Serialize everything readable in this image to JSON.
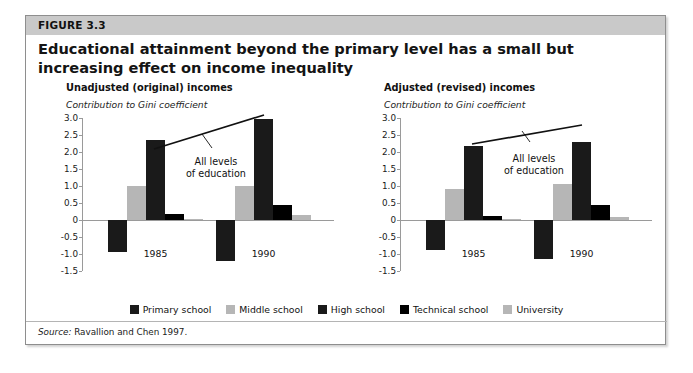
{
  "figure": {
    "number_label": "FIGURE 3.3",
    "title": "Educational attainment beyond the primary level has a small but increasing effect on income inequality",
    "source_label": "Source:",
    "source_text": " Ravallion and Chen 1997."
  },
  "legend": {
    "items": [
      {
        "label": "Primary school",
        "color": "#1a1a1a"
      },
      {
        "label": "Middle school",
        "color": "#b6b6b6"
      },
      {
        "label": "High school",
        "color": "#1a1a1a"
      },
      {
        "label": "Technical school",
        "color": "#000000"
      },
      {
        "label": "University",
        "color": "#b6b6b6"
      }
    ]
  },
  "chart_data": [
    {
      "type": "bar",
      "panel_id": "left",
      "title": "Unadjusted (original) incomes",
      "ylabel": "Contribution to Gini coefficient",
      "xlabel": "",
      "categories": [
        "1985",
        "1990"
      ],
      "ylim": [
        -1.5,
        3.0
      ],
      "ytick_labels": [
        "3.0",
        "2.5",
        "2.0",
        "1.5",
        "1.0",
        "0.5",
        "0",
        "-0.5",
        "-1.0",
        "-1.5"
      ],
      "ytick_values": [
        3.0,
        2.5,
        2.0,
        1.5,
        1.0,
        0.5,
        0.0,
        -0.5,
        -1.0,
        -1.5
      ],
      "grid": false,
      "legend_position": "bottom",
      "annotation": "All levels\nof education",
      "annotation_line1": "All levels",
      "annotation_line2": "of education",
      "series": [
        {
          "name": "Primary school",
          "values": [
            -0.95,
            -1.2
          ]
        },
        {
          "name": "Middle school",
          "values": [
            1.0,
            1.0
          ]
        },
        {
          "name": "High school",
          "values": [
            2.35,
            2.97
          ]
        },
        {
          "name": "Technical school",
          "values": [
            0.17,
            0.43
          ]
        },
        {
          "name": "University",
          "values": [
            0.02,
            0.14
          ]
        }
      ]
    },
    {
      "type": "bar",
      "panel_id": "right",
      "title": "Adjusted (revised) incomes",
      "ylabel": "Contribution to Gini coefficient",
      "xlabel": "",
      "categories": [
        "1985",
        "1990"
      ],
      "ylim": [
        -1.5,
        3.0
      ],
      "ytick_labels": [
        "3.0",
        "2.5",
        "2.0",
        "1.5",
        "1.0",
        "0.5",
        "0",
        "-0.5",
        "-1.0",
        "-1.5"
      ],
      "ytick_values": [
        3.0,
        2.5,
        2.0,
        1.5,
        1.0,
        0.5,
        0.0,
        -0.5,
        -1.0,
        -1.5
      ],
      "grid": false,
      "legend_position": "bottom",
      "annotation": "All levels\nof education",
      "annotation_line1": "All levels",
      "annotation_line2": "of education",
      "series": [
        {
          "name": "Primary school",
          "values": [
            -0.88,
            -1.15
          ]
        },
        {
          "name": "Middle school",
          "values": [
            0.92,
            1.05
          ]
        },
        {
          "name": "High school",
          "values": [
            2.19,
            2.29
          ]
        },
        {
          "name": "Technical school",
          "values": [
            0.12,
            0.43
          ]
        },
        {
          "name": "University",
          "values": [
            0.01,
            0.1
          ]
        }
      ]
    }
  ]
}
